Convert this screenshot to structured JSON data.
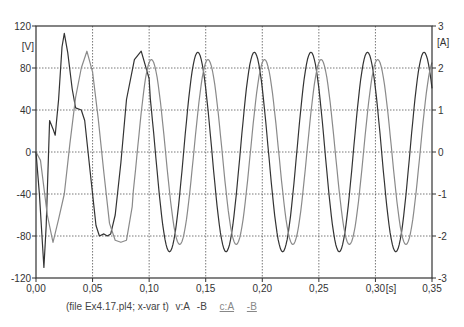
{
  "chart_data": {
    "type": "line",
    "title": "",
    "xlabel": "[s]",
    "ylabel_left": "[V]",
    "ylabel_right": "[A]",
    "xlim": [
      0,
      0.35
    ],
    "ylim_left": [
      -120,
      120
    ],
    "ylim_right": [
      -3,
      3
    ],
    "grid": true,
    "x_ticks": [
      "0,00",
      "0,05",
      "0,10",
      "0,15",
      "0,20",
      "0,25",
      "0,30",
      "0,35"
    ],
    "y_ticks_left": [
      "120",
      "80",
      "40",
      "0",
      "-40",
      "-80",
      "-120"
    ],
    "y_ticks_right": [
      "3",
      "2",
      "1",
      "0",
      "-1",
      "-2",
      "-3"
    ],
    "series": [
      {
        "name": "v:A -B",
        "axis": "left",
        "color": "#333333",
        "points": [
          [
            0,
            0
          ],
          [
            0.003,
            -40
          ],
          [
            0.007,
            -110
          ],
          [
            0.009,
            -70
          ],
          [
            0.012,
            30
          ],
          [
            0.015,
            22
          ],
          [
            0.017,
            16
          ],
          [
            0.02,
            50
          ],
          [
            0.023,
            100
          ],
          [
            0.025,
            113
          ],
          [
            0.028,
            95
          ],
          [
            0.032,
            60
          ],
          [
            0.035,
            42
          ],
          [
            0.04,
            40
          ],
          [
            0.043,
            30
          ],
          [
            0.048,
            -20
          ],
          [
            0.053,
            -70
          ],
          [
            0.056,
            -80
          ],
          [
            0.06,
            -78
          ],
          [
            0.063,
            -80
          ],
          [
            0.066,
            -78
          ],
          [
            0.07,
            -60
          ],
          [
            0.075,
            -10
          ],
          [
            0.08,
            50
          ],
          [
            0.087,
            88
          ],
          [
            0.093,
            96
          ],
          [
            0.1,
            70
          ]
        ],
        "steady_state": {
          "amplitude": 95,
          "period": 0.05,
          "peak_times": [
            0.093,
            0.143,
            0.193,
            0.243,
            0.292,
            0.342
          ]
        }
      },
      {
        "name": "c:A -B",
        "axis": "right",
        "color": "#8a8a8a",
        "points": [
          [
            0,
            0
          ],
          [
            0.004,
            -0.2
          ],
          [
            0.01,
            -1.5
          ],
          [
            0.015,
            -2.15
          ],
          [
            0.02,
            -1.6
          ],
          [
            0.025,
            -1.0
          ],
          [
            0.03,
            0.2
          ],
          [
            0.035,
            1.3
          ],
          [
            0.04,
            2.0
          ],
          [
            0.045,
            2.4
          ],
          [
            0.05,
            1.9
          ],
          [
            0.055,
            0.8
          ],
          [
            0.06,
            -0.5
          ],
          [
            0.065,
            -1.7
          ],
          [
            0.07,
            -2.1
          ],
          [
            0.075,
            -2.15
          ],
          [
            0.08,
            -2.1
          ],
          [
            0.085,
            -1.3
          ]
        ],
        "steady_state": {
          "amplitude": 2.2,
          "period": 0.05,
          "peak_times": [
            0.102,
            0.152,
            0.203,
            0.253,
            0.302,
            0.35
          ]
        }
      }
    ],
    "legend": "(file Ex4.17.pl4; x-var t) v:A -B c:A -B"
  },
  "legend": {
    "file": "(file Ex4.17.pl4; x-var t)",
    "v_a": "v:A",
    "v_b": "-B",
    "c_a": "c:A",
    "c_b": "-B"
  },
  "axes": {
    "left_unit": "[V]",
    "right_unit": "[A]",
    "x_unit": "[s]"
  }
}
